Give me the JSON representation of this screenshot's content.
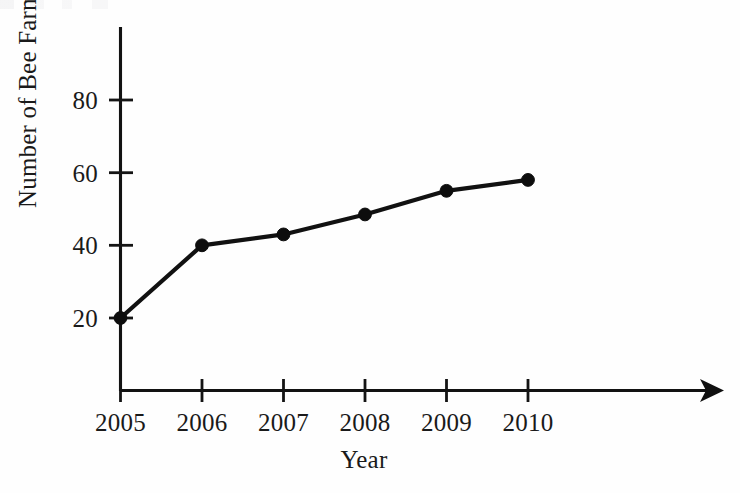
{
  "chart_data": {
    "type": "line",
    "title": "",
    "xlabel": "Year",
    "ylabel": "Number of Bee Farms",
    "categories": [
      "2005",
      "2006",
      "2007",
      "2008",
      "2009",
      "2010"
    ],
    "x": [
      2005,
      2006,
      2007,
      2008,
      2009,
      2010
    ],
    "values": [
      20,
      40,
      43,
      48.5,
      55,
      58
    ],
    "series": [
      {
        "name": "Number of Bee Farms",
        "values": [
          20,
          40,
          43,
          48.5,
          55,
          58
        ]
      }
    ],
    "ytick_labels": [
      "20",
      "40",
      "60",
      "80"
    ],
    "ytick_values": [
      20,
      40,
      60,
      80
    ],
    "xtick_labels": [
      "2005",
      "2006",
      "2007",
      "2008",
      "2009",
      "2010"
    ],
    "ylim": [
      0,
      92
    ],
    "xlim": [
      2004.55,
      2011.85
    ],
    "grid": false,
    "legend": false,
    "legend_position": "none",
    "marker": "filled-circle",
    "line_color": "#111111",
    "marker_color": "#0d0d0d",
    "background_color": "#ffffff",
    "x_axis_arrow": true,
    "y_axis_arrow": false,
    "annotations": []
  },
  "figure": {
    "ylabel_text": "Number of Bee Farms",
    "xlabel_text": "Year"
  },
  "axis": {
    "y_ticks": [
      {
        "label": "80",
        "value": 80
      },
      {
        "label": "60",
        "value": 60
      },
      {
        "label": "40",
        "value": 40
      },
      {
        "label": "20",
        "value": 20
      }
    ],
    "x_ticks": [
      {
        "label": "2005",
        "value": 2005
      },
      {
        "label": "2006",
        "value": 2006
      },
      {
        "label": "2007",
        "value": 2007
      },
      {
        "label": "2008",
        "value": 2008
      },
      {
        "label": "2009",
        "value": 2009
      },
      {
        "label": "2010",
        "value": 2010
      }
    ]
  }
}
